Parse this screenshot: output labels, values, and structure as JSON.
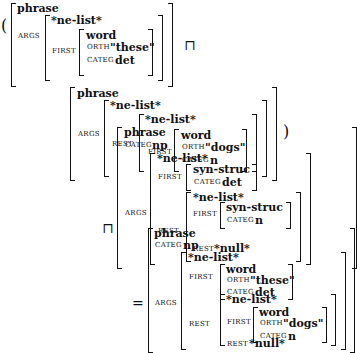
{
  "operand1": {
    "type": "phrase",
    "args_label": "ARGS",
    "args": {
      "type": "*ne-list*",
      "first_label": "FIRST",
      "first": {
        "type": "word",
        "orth_label": "ORTH",
        "orth": "\"these\"",
        "categ_label": "CATEG",
        "categ": "det"
      }
    }
  },
  "operand2": {
    "type": "phrase",
    "args_label": "ARGS",
    "args": {
      "type": "*ne-list*",
      "rest_label": "REST",
      "rest": {
        "type": "*ne-list*",
        "first_label": "FIRST",
        "first": {
          "type": "word",
          "orth_label": "ORTH",
          "orth": "\"dogs\"",
          "categ_label": "CATEG",
          "categ": "n"
        }
      }
    }
  },
  "operand3": {
    "type": "phrase",
    "categ_label": "CATEG",
    "categ": "np",
    "args_label": "ARGS",
    "args": {
      "type": "*ne-list*",
      "first_label": "FIRST",
      "first": {
        "type": "syn-struc",
        "categ_label": "CATEG",
        "categ": "det"
      },
      "rest_label": "REST",
      "rest": {
        "type": "*ne-list*",
        "first_label": "FIRST",
        "first": {
          "type": "syn-struc",
          "categ_label": "CATEG",
          "categ": "n"
        },
        "rest_label": "REST",
        "rest": "*null*"
      }
    }
  },
  "result": {
    "type": "phrase",
    "categ_label": "CATEG",
    "categ": "np",
    "args_label": "ARGS",
    "args": {
      "type": "*ne-list*",
      "first_label": "FIRST",
      "first": {
        "type": "word",
        "orth_label": "ORTH",
        "orth": "\"these\"",
        "categ_label": "CATEG",
        "categ": "det"
      },
      "rest_label": "REST",
      "rest": {
        "type": "*ne-list*",
        "first_label": "FIRST",
        "first": {
          "type": "word",
          "orth_label": "ORTH",
          "orth": "\"dogs\"",
          "categ_label": "CATEG",
          "categ": "n"
        },
        "rest_label": "REST",
        "rest": "*null*"
      }
    }
  },
  "operators": {
    "open_paren": "(",
    "close_paren": ")",
    "unify1": "⊓",
    "unify2": "⊓",
    "equals": "="
  }
}
